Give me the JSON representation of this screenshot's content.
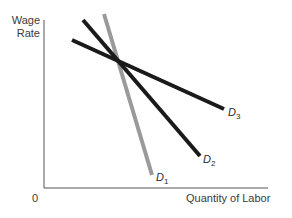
{
  "axes": {
    "y_label_line1": "Wage",
    "y_label_line2": "Rate",
    "x_label": "Quantity of Labor",
    "origin": "0"
  },
  "curves": [
    {
      "name": "D",
      "sub": "1",
      "color": "#9a9a9a",
      "x1": 104,
      "y1": 14,
      "x2": 152,
      "y2": 175,
      "lx": 156,
      "ly": 171
    },
    {
      "name": "D",
      "sub": "2",
      "color": "#1a1a1a",
      "x1": 83,
      "y1": 20,
      "x2": 200,
      "y2": 156,
      "lx": 203,
      "ly": 153
    },
    {
      "name": "D",
      "sub": "3",
      "color": "#1a1a1a",
      "x1": 72,
      "y1": 40,
      "x2": 224,
      "y2": 109,
      "lx": 228,
      "ly": 106
    }
  ]
}
